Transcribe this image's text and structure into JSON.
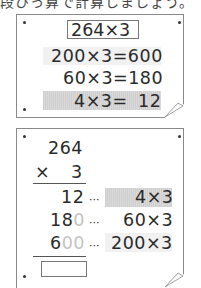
{
  "header": {
    "cutoff_text": "段ひっ算で計算しましょう。"
  },
  "top_card": {
    "problem": "264×3",
    "rows": [
      {
        "expr": "200×3=600",
        "highlight": "light"
      },
      {
        "expr": "60×3=180",
        "highlight": "none"
      },
      {
        "expr": "4×3=",
        "result": "12",
        "highlight": "gray"
      }
    ]
  },
  "bottom_card": {
    "multiplicand": "264",
    "operator": "×",
    "multiplier": "3",
    "partials": [
      {
        "digits": "12",
        "trace": "",
        "sep": "···",
        "expr": "4×3",
        "highlight": "gray"
      },
      {
        "digits": "18",
        "trace": "0",
        "sep": "···",
        "expr": "60×3",
        "highlight": "none"
      },
      {
        "digits": "6",
        "trace": "00",
        "sep": "···",
        "expr": "200×3",
        "highlight": "light"
      }
    ],
    "answer": ""
  },
  "colors": {
    "highlight_gray": "#d4d4d4",
    "highlight_light": "#f1f1f1",
    "border": "#8a8a8a"
  }
}
